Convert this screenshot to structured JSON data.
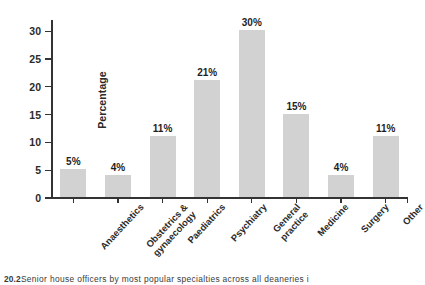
{
  "chart_data": {
    "type": "bar",
    "title": "",
    "subtitle": "",
    "xlabel": "",
    "ylabel": "Percentage",
    "ylim": [
      0,
      32
    ],
    "yticks": [
      0,
      5,
      10,
      15,
      20,
      25,
      30
    ],
    "ytick_labels": [
      "0",
      "5",
      "10",
      "15",
      "20",
      "25",
      "30"
    ],
    "grid": false,
    "legend": false,
    "legend_position": "none",
    "bar_color": "#d2d2d2",
    "axis_color": "#333333",
    "categories": [
      "Anaesthetics",
      "Obstetrics & gynaecology",
      "Paediatrics",
      "Psychiatry",
      "General practice",
      "Medicine",
      "Surgery",
      "Other"
    ],
    "category_lines": [
      [
        "Anaesthetics"
      ],
      [
        "Obstetrics &",
        "gynaecology"
      ],
      [
        "Paediatrics"
      ],
      [
        "Psychiatry"
      ],
      [
        "General",
        "practice"
      ],
      [
        "Medicine"
      ],
      [
        "Surgery"
      ],
      [
        "Other"
      ]
    ],
    "values": [
      5,
      4,
      11,
      21,
      30,
      15,
      4,
      11
    ],
    "value_labels": [
      "5%",
      "4%",
      "11%",
      "21%",
      "30%",
      "15%",
      "4%",
      "11%"
    ]
  },
  "caption": {
    "number": "20.2",
    "text": "Senior house officers by most popular specialties across all deaneries i"
  }
}
